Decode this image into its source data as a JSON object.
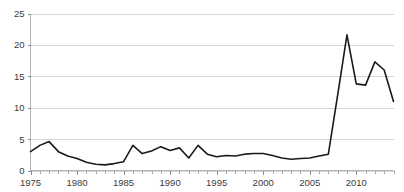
{
  "chart_data": {
    "type": "line",
    "title": "",
    "subtitle": "",
    "xlabel": "",
    "ylabel": "",
    "xlim": [
      1975,
      2014
    ],
    "ylim": [
      0,
      25
    ],
    "yticks": [
      0,
      5,
      10,
      15,
      20,
      25
    ],
    "ytick_labels": [
      "0",
      "5",
      "10",
      "15",
      "20",
      "25"
    ],
    "xticks": [
      1975,
      1980,
      1985,
      1990,
      1995,
      2000,
      2005,
      2010
    ],
    "xtick_labels": [
      "1975",
      "1980",
      "1985",
      "1990",
      "1995",
      "2000",
      "2005",
      "2010"
    ],
    "x_minor_tick_interval": 1,
    "grid": {
      "horizontal": true,
      "vertical": false
    },
    "legend": {
      "visible": false,
      "position": "none"
    },
    "line_color": "#1a1a1a",
    "grid_color": "#d6d6d6",
    "axis_color": "#b5b5b5",
    "background_color": "#ffffff",
    "x": [
      1975,
      1976,
      1977,
      1978,
      1979,
      1980,
      1981,
      1982,
      1983,
      1984,
      1985,
      1986,
      1987,
      1988,
      1989,
      1990,
      1991,
      1992,
      1993,
      1994,
      1995,
      1996,
      1997,
      1998,
      1999,
      2000,
      2001,
      2002,
      2003,
      2004,
      2005,
      2006,
      2007,
      2008,
      2009,
      2010,
      2011,
      2012,
      2013,
      2014
    ],
    "series": [
      {
        "name": "series-1",
        "values": [
          3.0,
          4.0,
          4.6,
          3.0,
          2.3,
          1.9,
          1.3,
          1.0,
          0.9,
          1.1,
          1.4,
          4.0,
          2.7,
          3.1,
          3.8,
          3.2,
          3.6,
          2.0,
          4.0,
          2.6,
          2.2,
          2.4,
          2.3,
          2.6,
          2.7,
          2.7,
          2.4,
          2.0,
          1.8,
          1.9,
          2.0,
          2.3,
          2.6,
          12.0,
          21.6,
          13.8,
          13.6,
          17.3,
          16.0,
          11.0
        ]
      }
    ]
  }
}
